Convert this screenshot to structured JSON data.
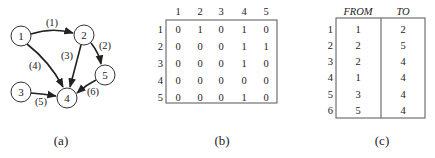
{
  "panel_a": {
    "caption": "(a)",
    "nodes": [
      {
        "id": "1",
        "x": 21,
        "y": 36
      },
      {
        "id": "2",
        "x": 84,
        "y": 35
      },
      {
        "id": "3",
        "x": 21,
        "y": 92
      },
      {
        "id": "4",
        "x": 67,
        "y": 98
      },
      {
        "id": "5",
        "x": 105,
        "y": 75
      }
    ],
    "edges": [
      {
        "label": "(1)",
        "from": "1",
        "to": "2"
      },
      {
        "label": "(2)",
        "from": "2",
        "to": "5"
      },
      {
        "label": "(3)",
        "from": "2",
        "to": "4"
      },
      {
        "label": "(4)",
        "from": "1",
        "to": "4"
      },
      {
        "label": "(5)",
        "from": "3",
        "to": "4"
      },
      {
        "label": "(6)",
        "from": "5",
        "to": "4"
      }
    ]
  },
  "panel_b": {
    "caption": "(b)",
    "col_headers": [
      "1",
      "2",
      "3",
      "4",
      "5"
    ],
    "row_headers": [
      "1",
      "2",
      "3",
      "4",
      "5"
    ],
    "matrix": [
      [
        "0",
        "1",
        "0",
        "1",
        "0"
      ],
      [
        "0",
        "0",
        "0",
        "1",
        "1"
      ],
      [
        "0",
        "0",
        "0",
        "1",
        "0"
      ],
      [
        "0",
        "0",
        "0",
        "0",
        "0"
      ],
      [
        "0",
        "0",
        "0",
        "1",
        "0"
      ]
    ]
  },
  "panel_c": {
    "caption": "(c)",
    "headers": {
      "from": "FROM",
      "to": "TO"
    },
    "row_headers": [
      "1",
      "2",
      "3",
      "4",
      "5",
      "6"
    ],
    "rows": [
      {
        "from": "1",
        "to": "2"
      },
      {
        "from": "2",
        "to": "5"
      },
      {
        "from": "2",
        "to": "4"
      },
      {
        "from": "1",
        "to": "4"
      },
      {
        "from": "3",
        "to": "4"
      },
      {
        "from": "5",
        "to": "4"
      }
    ]
  }
}
